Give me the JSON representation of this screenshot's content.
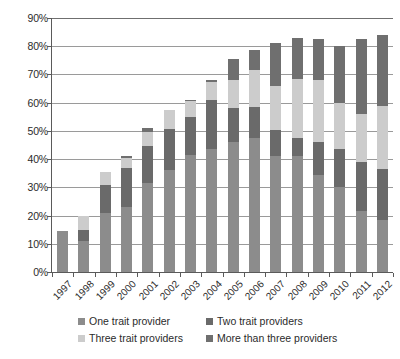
{
  "chart_data": {
    "type": "bar",
    "subtype": "stacked-vertical",
    "title": "",
    "subtitle": "",
    "xlabel": "",
    "ylabel": "",
    "ylim": [
      0,
      90
    ],
    "ytick_labels": [
      "0%",
      "10%",
      "20%",
      "30%",
      "40%",
      "50%",
      "60%",
      "70%",
      "80%",
      "90%"
    ],
    "ytick_values": [
      0,
      10,
      20,
      30,
      40,
      50,
      60,
      70,
      80,
      90
    ],
    "grid": true,
    "legend_position": "bottom",
    "categories": [
      "1997",
      "1998",
      "1999",
      "2000",
      "2001",
      "2002",
      "2003",
      "2004",
      "2005",
      "2006",
      "2007",
      "2008",
      "2009",
      "2010",
      "2011",
      "2012"
    ],
    "series": [
      {
        "name": "One trait provider",
        "color": "#8c8c8c",
        "values": [
          14.5,
          11.0,
          21.0,
          23.0,
          31.5,
          36.0,
          41.5,
          43.5,
          46.0,
          47.5,
          41.0,
          41.0,
          34.5,
          30.0,
          21.5,
          18.5
        ]
      },
      {
        "name": "Two trait providers",
        "color": "#6a6a6a",
        "values": [
          0.0,
          4.0,
          10.0,
          14.0,
          13.0,
          14.5,
          13.5,
          17.5,
          12.0,
          11.0,
          9.5,
          6.5,
          11.5,
          13.5,
          17.5,
          18.0
        ]
      },
      {
        "name": "Three trait providers",
        "color": "#cccccc",
        "values": [
          0.0,
          5.0,
          4.5,
          3.5,
          5.0,
          7.0,
          5.5,
          6.5,
          10.0,
          13.0,
          15.5,
          21.0,
          22.0,
          16.5,
          17.0,
          22.5
        ]
      },
      {
        "name": "More than three providers",
        "color": "#6f6f6f",
        "values": [
          0.0,
          0.0,
          0.0,
          0.5,
          1.5,
          0.0,
          0.5,
          0.5,
          7.5,
          7.0,
          15.0,
          14.5,
          14.5,
          20.0,
          26.5,
          25.0
        ]
      }
    ],
    "totals": [
      14.5,
      20.0,
      35.5,
      41.0,
      51.0,
      57.5,
      61.0,
      68.0,
      75.5,
      78.5,
      81.0,
      83.0,
      82.5,
      80.0,
      82.5,
      84.0
    ]
  },
  "legend": {
    "items": [
      {
        "label": "One trait provider",
        "color": "#8c8c8c"
      },
      {
        "label": "Two trait providers",
        "color": "#6a6a6a"
      },
      {
        "label": "Three trait providers",
        "color": "#cccccc"
      },
      {
        "label": "More than three providers",
        "color": "#6f6f6f"
      }
    ]
  }
}
